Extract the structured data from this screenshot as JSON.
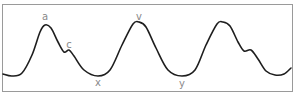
{
  "diagram": {
    "type": "waveform",
    "colors": {
      "curve": "#1e1e1e",
      "label": "#8a8a8a",
      "border": "#9a9a9a",
      "background": "#ffffff"
    },
    "labels": [
      {
        "id": "a",
        "text": "a",
        "x": 45,
        "y": 12
      },
      {
        "id": "c",
        "text": "c",
        "x": 69,
        "y": 40
      },
      {
        "id": "x",
        "text": "x",
        "x": 98,
        "y": 78
      },
      {
        "id": "v",
        "text": "v",
        "x": 139,
        "y": 12
      },
      {
        "id": "y",
        "text": "y",
        "x": 182,
        "y": 79
      }
    ],
    "curve_points": [
      [
        3,
        74
      ],
      [
        12,
        76
      ],
      [
        22,
        73
      ],
      [
        32,
        55
      ],
      [
        40,
        32
      ],
      [
        45,
        25
      ],
      [
        51,
        28
      ],
      [
        58,
        42
      ],
      [
        64,
        52
      ],
      [
        69,
        50
      ],
      [
        74,
        56
      ],
      [
        84,
        70
      ],
      [
        98,
        76
      ],
      [
        110,
        70
      ],
      [
        122,
        45
      ],
      [
        133,
        24
      ],
      [
        139,
        22
      ],
      [
        146,
        27
      ],
      [
        156,
        48
      ],
      [
        168,
        70
      ],
      [
        182,
        76
      ],
      [
        195,
        70
      ],
      [
        206,
        45
      ],
      [
        217,
        24
      ],
      [
        223,
        22
      ],
      [
        230,
        26
      ],
      [
        238,
        42
      ],
      [
        244,
        51
      ],
      [
        251,
        50
      ],
      [
        258,
        59
      ],
      [
        266,
        71
      ],
      [
        275,
        75
      ],
      [
        284,
        74
      ],
      [
        291,
        68
      ]
    ]
  }
}
